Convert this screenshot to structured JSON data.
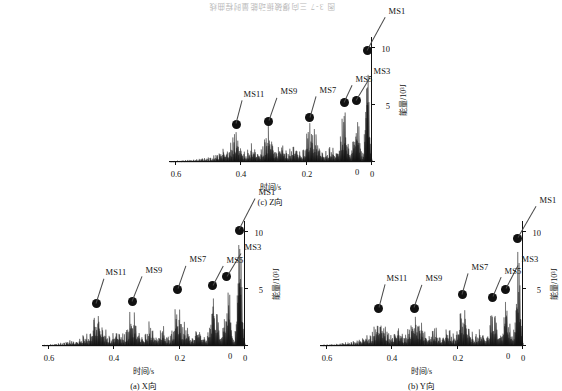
{
  "figure": {
    "cut_caption": "图 3-7 三向爆破振动能量时程曲线",
    "background_color": "#ffffff",
    "ink_color": "#111111"
  },
  "chart_data": [
    {
      "id": "panel-a",
      "type": "area",
      "title": "(a) X向",
      "caption_index": "(a)",
      "caption_text": "X向",
      "xlabel": "时间/s",
      "ylabel": "能量/10³J",
      "xlim": [
        0,
        0.62
      ],
      "ylim": [
        0,
        11
      ],
      "xticks": [
        0,
        0.2,
        0.4,
        0.6
      ],
      "xticklabels": [
        "0",
        "0.2",
        "0.4",
        "0.6"
      ],
      "yticks": [
        0,
        5,
        10
      ],
      "yticklabels": [
        "0",
        "5",
        "10"
      ],
      "grid": false,
      "legend": null,
      "y_axis_inverted": true,
      "annotations": [
        {
          "label": "MS1",
          "x": 0.018,
          "y": 10.2
        },
        {
          "label": "MS3",
          "x": 0.055,
          "y": 6.1
        },
        {
          "label": "MS5",
          "x": 0.098,
          "y": 5.3
        },
        {
          "label": "MS7",
          "x": 0.205,
          "y": 5.0
        },
        {
          "label": "MS9",
          "x": 0.345,
          "y": 3.9
        },
        {
          "label": "MS11",
          "x": 0.455,
          "y": 3.7
        }
      ],
      "series": [
        {
          "name": "X向能量",
          "x": [
            0,
            0.004,
            0.008,
            0.012,
            0.015,
            0.018,
            0.021,
            0.025,
            0.03,
            0.035,
            0.04,
            0.045,
            0.05,
            0.055,
            0.06,
            0.066,
            0.072,
            0.078,
            0.085,
            0.092,
            0.098,
            0.104,
            0.11,
            0.118,
            0.126,
            0.134,
            0.142,
            0.15,
            0.158,
            0.166,
            0.174,
            0.182,
            0.19,
            0.198,
            0.205,
            0.212,
            0.22,
            0.228,
            0.236,
            0.244,
            0.252,
            0.26,
            0.27,
            0.28,
            0.29,
            0.3,
            0.31,
            0.32,
            0.33,
            0.338,
            0.345,
            0.352,
            0.36,
            0.37,
            0.38,
            0.39,
            0.4,
            0.41,
            0.42,
            0.43,
            0.44,
            0.448,
            0.455,
            0.462,
            0.47,
            0.48,
            0.49,
            0.5,
            0.51,
            0.52,
            0.53,
            0.545,
            0.56,
            0.58,
            0.6,
            0.62
          ],
          "values": [
            0.3,
            1.2,
            4.0,
            8.5,
            9.6,
            10.2,
            8.2,
            4.1,
            1.6,
            0.9,
            2.2,
            4.4,
            5.6,
            6.1,
            4.6,
            2.3,
            1.1,
            1.9,
            3.6,
            4.8,
            5.3,
            4.0,
            2.0,
            1.0,
            0.9,
            1.4,
            2.4,
            1.6,
            1.1,
            0.8,
            1.6,
            2.6,
            1.8,
            3.0,
            5.0,
            3.6,
            1.9,
            1.1,
            0.8,
            1.4,
            2.2,
            1.3,
            0.9,
            1.5,
            2.4,
            1.7,
            1.0,
            1.4,
            2.1,
            3.0,
            3.9,
            3.0,
            1.8,
            1.1,
            1.4,
            2.0,
            1.5,
            0.9,
            1.2,
            1.9,
            2.6,
            3.2,
            3.7,
            2.8,
            1.7,
            1.0,
            1.3,
            0.9,
            0.7,
            0.5,
            0.6,
            0.4,
            0.3,
            0.2,
            0.15,
            0.1
          ]
        }
      ]
    },
    {
      "id": "panel-b",
      "type": "area",
      "title": "(b) Y向",
      "caption_index": "(b)",
      "caption_text": "Y向",
      "xlabel": "时间/s",
      "ylabel": "能量/10³J",
      "xlim": [
        0,
        0.62
      ],
      "ylim": [
        0,
        11
      ],
      "xticks": [
        0,
        0.2,
        0.4,
        0.6
      ],
      "xticklabels": [
        "0",
        "0.2",
        "0.4",
        "0.6"
      ],
      "yticks": [
        0,
        5,
        10
      ],
      "yticklabels": [
        "0",
        "5",
        "10"
      ],
      "grid": false,
      "legend": null,
      "y_axis_inverted": true,
      "annotations": [
        {
          "label": "MS1",
          "x": 0.016,
          "y": 9.5
        },
        {
          "label": "MS3",
          "x": 0.052,
          "y": 5.0
        },
        {
          "label": "MS5",
          "x": 0.092,
          "y": 4.3
        },
        {
          "label": "MS7",
          "x": 0.185,
          "y": 4.5
        },
        {
          "label": "MS9",
          "x": 0.332,
          "y": 3.3
        },
        {
          "label": "MS11",
          "x": 0.44,
          "y": 3.3
        }
      ],
      "series": [
        {
          "name": "Y向能量",
          "x": [
            0,
            0.004,
            0.008,
            0.012,
            0.016,
            0.02,
            0.024,
            0.03,
            0.035,
            0.04,
            0.046,
            0.052,
            0.058,
            0.064,
            0.07,
            0.078,
            0.085,
            0.092,
            0.099,
            0.106,
            0.114,
            0.122,
            0.13,
            0.14,
            0.15,
            0.16,
            0.17,
            0.178,
            0.185,
            0.192,
            0.2,
            0.21,
            0.22,
            0.23,
            0.24,
            0.25,
            0.26,
            0.27,
            0.28,
            0.29,
            0.3,
            0.31,
            0.322,
            0.332,
            0.342,
            0.352,
            0.362,
            0.372,
            0.382,
            0.392,
            0.402,
            0.412,
            0.422,
            0.432,
            0.44,
            0.45,
            0.46,
            0.47,
            0.48,
            0.49,
            0.5,
            0.515,
            0.53,
            0.55,
            0.57,
            0.6,
            0.62
          ],
          "values": [
            0.4,
            1.5,
            4.5,
            8.0,
            9.5,
            7.4,
            3.6,
            1.4,
            0.9,
            2.0,
            3.8,
            5.0,
            3.6,
            1.8,
            1.0,
            2.0,
            3.4,
            4.3,
            3.2,
            1.6,
            0.9,
            1.2,
            1.9,
            1.3,
            1.0,
            1.7,
            2.8,
            3.7,
            4.5,
            3.4,
            1.8,
            1.0,
            1.4,
            2.2,
            1.5,
            0.9,
            1.3,
            2.0,
            1.4,
            0.9,
            1.4,
            2.2,
            2.9,
            3.3,
            2.5,
            1.5,
            0.9,
            1.3,
            1.9,
            1.4,
            0.9,
            1.3,
            2.1,
            2.8,
            3.3,
            2.4,
            1.4,
            0.9,
            1.1,
            0.8,
            0.6,
            0.5,
            0.4,
            0.3,
            0.2,
            0.15,
            0.1
          ]
        }
      ]
    },
    {
      "id": "panel-c",
      "type": "area",
      "title": "(c) Z向",
      "caption_index": "(c)",
      "caption_text": "Z向",
      "xlabel": "时间/s",
      "ylabel": "能量/10³J",
      "xlim": [
        0,
        0.62
      ],
      "ylim": [
        0,
        11
      ],
      "xticks": [
        0,
        0.2,
        0.4,
        0.6
      ],
      "xticklabels": [
        "0",
        "0.2",
        "0.4",
        "0.6"
      ],
      "yticks": [
        0,
        5,
        10
      ],
      "yticklabels": [
        "0",
        "5",
        "10"
      ],
      "grid": false,
      "legend": null,
      "y_axis_inverted": true,
      "annotations": [
        {
          "label": "MS1",
          "x": 0.014,
          "y": 9.8
        },
        {
          "label": "MS3",
          "x": 0.048,
          "y": 5.4
        },
        {
          "label": "MS5",
          "x": 0.085,
          "y": 5.2
        },
        {
          "label": "MS7",
          "x": 0.19,
          "y": 3.9
        },
        {
          "label": "MS9",
          "x": 0.315,
          "y": 3.6
        },
        {
          "label": "MS11",
          "x": 0.415,
          "y": 3.3
        }
      ],
      "series": [
        {
          "name": "Z向能量",
          "x": [
            0,
            0.004,
            0.008,
            0.012,
            0.014,
            0.018,
            0.022,
            0.028,
            0.034,
            0.04,
            0.044,
            0.048,
            0.054,
            0.06,
            0.068,
            0.076,
            0.085,
            0.093,
            0.1,
            0.108,
            0.116,
            0.126,
            0.136,
            0.146,
            0.156,
            0.166,
            0.176,
            0.183,
            0.19,
            0.198,
            0.206,
            0.216,
            0.226,
            0.236,
            0.246,
            0.256,
            0.266,
            0.276,
            0.286,
            0.296,
            0.305,
            0.315,
            0.325,
            0.335,
            0.345,
            0.355,
            0.365,
            0.375,
            0.385,
            0.395,
            0.405,
            0.415,
            0.425,
            0.435,
            0.445,
            0.455,
            0.465,
            0.475,
            0.49,
            0.505,
            0.52,
            0.54,
            0.56,
            0.58,
            0.6,
            0.62
          ],
          "values": [
            0.3,
            1.3,
            4.2,
            8.4,
            9.8,
            7.2,
            3.2,
            1.3,
            1.0,
            3.2,
            4.6,
            5.4,
            3.8,
            1.6,
            1.1,
            3.0,
            5.2,
            3.8,
            1.9,
            1.0,
            1.2,
            1.8,
            1.2,
            0.9,
            1.5,
            2.4,
            3.2,
            3.6,
            3.9,
            2.8,
            1.6,
            1.0,
            1.4,
            2.2,
            1.5,
            0.9,
            1.3,
            2.1,
            1.4,
            1.0,
            2.4,
            3.6,
            2.6,
            1.5,
            1.0,
            1.4,
            2.0,
            1.4,
            0.9,
            1.3,
            2.2,
            3.3,
            2.4,
            1.4,
            1.0,
            1.3,
            0.9,
            0.7,
            0.5,
            0.4,
            0.35,
            0.25,
            0.2,
            0.15,
            0.12,
            0.08
          ]
        }
      ]
    }
  ]
}
